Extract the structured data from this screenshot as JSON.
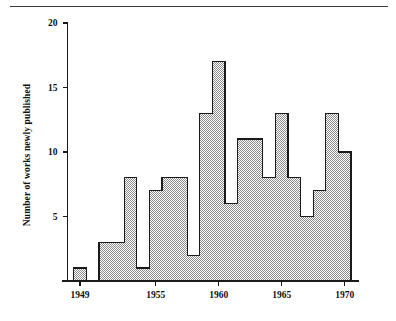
{
  "figure": {
    "rule_name": "top-horizontal-rule"
  },
  "chart_data": {
    "type": "bar",
    "title": "",
    "subtitle": "",
    "xlabel": "",
    "ylabel": "Number of works newly published",
    "categories": [
      "1949",
      "1950",
      "1951",
      "1952",
      "1953",
      "1954",
      "1955",
      "1956",
      "1957",
      "1958",
      "1959",
      "1960",
      "1961",
      "1962",
      "1963",
      "1964",
      "1965",
      "1966",
      "1967",
      "1968",
      "1969",
      "1970"
    ],
    "values": [
      1,
      0,
      3,
      3,
      8,
      1,
      7,
      8,
      8,
      2,
      13,
      17,
      6,
      11,
      11,
      8,
      13,
      8,
      5,
      7,
      13,
      10
    ],
    "xlim": [
      1948.5,
      1970.5
    ],
    "ylim": [
      0,
      20
    ],
    "x_ticks": [
      "1949",
      "1955",
      "1960",
      "1965",
      "1970"
    ],
    "x_tick_values": [
      1949,
      1955,
      1960,
      1965,
      1970
    ],
    "y_ticks": [
      "5",
      "10",
      "15",
      "20"
    ],
    "y_tick_values": [
      5,
      10,
      15,
      20
    ],
    "grid": false,
    "legend": null,
    "bar_fill": "#b3b3b3",
    "bar_edge": "#1a1a1a",
    "axis_color": "#1a1a1a",
    "background": "#ffffff",
    "style": "histogram-adjacent-bars-dither-fill"
  }
}
